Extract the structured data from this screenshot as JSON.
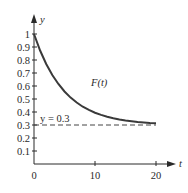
{
  "chart_data": {
    "type": "line",
    "title": "",
    "xlabel": "t",
    "ylabel": "y",
    "xlim": [
      0,
      20
    ],
    "ylim": [
      0,
      1
    ],
    "x_ticks": [
      0,
      10,
      20
    ],
    "x_tick_labels": [
      "0",
      "10",
      "20"
    ],
    "y_ticks": [
      0.1,
      0.2,
      0.3,
      0.4,
      0.5,
      0.6,
      0.7,
      0.8,
      0.9,
      1
    ],
    "y_tick_labels": [
      "0.1",
      "0.2",
      "0.3",
      "0.4",
      "0.5",
      "0.6",
      "0.7",
      "0.8",
      "0.9",
      "1"
    ],
    "grid": false,
    "series": [
      {
        "name": "F(t)",
        "style": "solid",
        "x": [
          0,
          1,
          2,
          3,
          4,
          5,
          6,
          7,
          8,
          9,
          10,
          11,
          12,
          13,
          14,
          15,
          16,
          17,
          18,
          19,
          20
        ],
        "values": [
          1.0,
          0.873,
          0.769,
          0.684,
          0.615,
          0.558,
          0.511,
          0.473,
          0.441,
          0.416,
          0.395,
          0.378,
          0.364,
          0.352,
          0.343,
          0.335,
          0.329,
          0.323,
          0.319,
          0.315,
          0.313
        ]
      },
      {
        "name": "y = 0.3",
        "style": "dashed",
        "x": [
          0,
          20
        ],
        "values": [
          0.3,
          0.3
        ]
      }
    ],
    "annotations": [
      {
        "text": "F(t)",
        "x": 9.5,
        "y": 0.6
      },
      {
        "text": "y = 0.3",
        "x": 0.8,
        "y": 0.33
      }
    ]
  },
  "labels": {
    "y_axis": "y",
    "t_axis": "t",
    "curve": "F(t)",
    "asymptote": "y = 0.3",
    "x0": "0",
    "x10": "10",
    "x20": "20",
    "y01": "0.1",
    "y02": "0.2",
    "y03": "0.3",
    "y04": "0.4",
    "y05": "0.5",
    "y06": "0.6",
    "y07": "0.7",
    "y08": "0.8",
    "y09": "0.9",
    "y1": "1"
  },
  "colors": {
    "curve": "#3a3a3a",
    "axis": "#2a2a2a",
    "dashed": "#444444"
  }
}
